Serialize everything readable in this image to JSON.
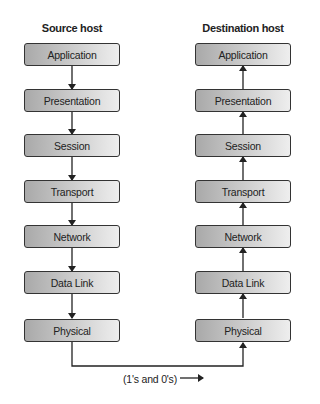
{
  "diagram": {
    "source_host": {
      "title": "Source host",
      "layers": [
        "Application",
        "Presentation",
        "Session",
        "Transport",
        "Network",
        "Data Link",
        "Physical"
      ]
    },
    "destination_host": {
      "title": "Destination host",
      "layers": [
        "Application",
        "Presentation",
        "Session",
        "Transport",
        "Network",
        "Data Link",
        "Physical"
      ]
    },
    "link_caption": "(1's and 0's)",
    "colors": {
      "box_border": "#333333",
      "gradient_dark": "#a9a9a9",
      "gradient_light": "#eeeeee",
      "line": "#222222"
    }
  }
}
